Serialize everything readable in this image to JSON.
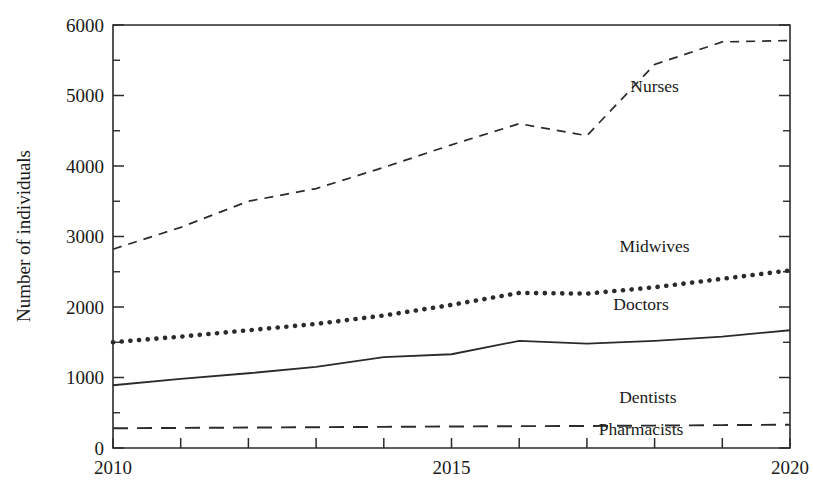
{
  "figure": {
    "title": "",
    "y_axis_title": "Number of individuals",
    "x_axis_title": ""
  },
  "axes": {
    "y_ticks": [
      "0",
      "1000",
      "2000",
      "3000",
      "4000",
      "5000",
      "6000"
    ],
    "x_ticks": [
      "2010",
      "2015",
      "2020"
    ]
  },
  "series_labels": {
    "nurses": "Nurses",
    "midwives": "Midwives",
    "doctors": "Doctors",
    "dentists": "Dentists",
    "pharmacists": "Pharmacists"
  },
  "chart_data": {
    "type": "line",
    "title": "",
    "xlabel": "",
    "ylabel": "Number of individuals",
    "xlim": [
      2010,
      2020
    ],
    "ylim": [
      0,
      6000
    ],
    "ymajor_step": 1000,
    "yminor_step": 500,
    "xtick_step": 1,
    "xtick_labeled": [
      2010,
      2015,
      2020
    ],
    "grid": false,
    "legend": "inline-labels",
    "x": [
      2010,
      2011,
      2012,
      2013,
      2014,
      2015,
      2016,
      2017,
      2018,
      2019,
      2020
    ],
    "series": [
      {
        "name": "Nurses",
        "style": "dashed",
        "values": [
          2820,
          3130,
          3500,
          3680,
          3980,
          4300,
          4600,
          4430,
          5440,
          5760,
          5780
        ]
      },
      {
        "name": "Midwives",
        "style": "dotted",
        "values": [
          1500,
          1580,
          1670,
          1760,
          1880,
          2030,
          2200,
          2190,
          2280,
          2400,
          2520
        ]
      },
      {
        "name": "Doctors",
        "style": "solid",
        "values": [
          890,
          980,
          1060,
          1150,
          1290,
          1330,
          1520,
          1480,
          1520,
          1580,
          1670
        ]
      },
      {
        "name": "Dentists",
        "style": "long-dashed",
        "values": [
          280,
          285,
          290,
          295,
          300,
          305,
          310,
          312,
          318,
          325,
          330
        ]
      },
      {
        "name": "Pharmacists",
        "style": "long-dashed",
        "values": [
          280,
          285,
          290,
          295,
          300,
          305,
          310,
          312,
          318,
          325,
          330
        ]
      }
    ],
    "annotations": [
      {
        "text": "Nurses",
        "x": 2018.0,
        "y": 5050
      },
      {
        "text": "Midwives",
        "x": 2018.0,
        "y": 2780
      },
      {
        "text": "Doctors",
        "x": 2017.8,
        "y": 1960
      },
      {
        "text": "Dentists",
        "x": 2017.9,
        "y": 640
      },
      {
        "text": "Pharmacists",
        "x": 2017.8,
        "y": 185
      }
    ]
  }
}
